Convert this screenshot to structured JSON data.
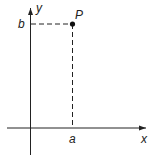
{
  "diagram": {
    "type": "cartesian-point",
    "colors": {
      "ink": "#222222",
      "background": "#ffffff"
    },
    "axes": {
      "x_label": "x",
      "y_label": "y"
    },
    "point": {
      "label": "P",
      "x_coord_label": "a",
      "y_coord_label": "b"
    }
  }
}
